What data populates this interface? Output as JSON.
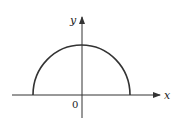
{
  "diagram": {
    "type": "semicircle-graph",
    "axes": {
      "x_label": "x",
      "y_label": "y",
      "origin_label": "0"
    },
    "curve": {
      "shape": "upper semicircle",
      "center": "origin",
      "color": "#333333"
    },
    "colors": {
      "axis": "#333333",
      "curve": "#333333",
      "background": "#ffffff"
    }
  }
}
